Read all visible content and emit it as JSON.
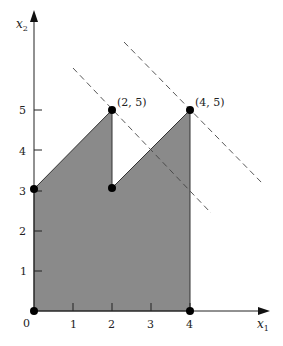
{
  "diagram": {
    "type": "feasible-region-plot",
    "axes": {
      "x_label": "x",
      "x_label_sub": "1",
      "y_label": "x",
      "y_label_sub": "2",
      "origin_label": "0",
      "x_ticks": [
        "1",
        "2",
        "3",
        "4"
      ],
      "y_ticks": [
        "1",
        "2",
        "3",
        "4",
        "5"
      ]
    },
    "region": {
      "fill": "#8a8a8a",
      "vertices": [
        [
          0,
          0
        ],
        [
          0,
          3
        ],
        [
          2,
          5
        ],
        [
          2,
          3
        ],
        [
          4,
          5
        ],
        [
          4,
          0
        ]
      ]
    },
    "points": [
      {
        "x": 0,
        "y": 0,
        "label": ""
      },
      {
        "x": 0,
        "y": 3,
        "label": ""
      },
      {
        "x": 2,
        "y": 5,
        "label": "(2, 5)"
      },
      {
        "x": 2,
        "y": 3,
        "label": ""
      },
      {
        "x": 4,
        "y": 5,
        "label": "(4, 5)"
      },
      {
        "x": 4,
        "y": 0,
        "label": ""
      }
    ],
    "dashed_lines": [
      {
        "description": "objective contour through (2, 5)"
      },
      {
        "description": "objective contour through (4, 5)"
      }
    ]
  }
}
